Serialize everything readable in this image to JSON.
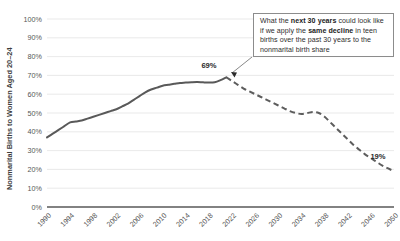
{
  "chart_data": {
    "type": "line",
    "title": "",
    "xlabel": "",
    "ylabel": "Nonmarital Births to Women Aged 20–24",
    "ylim": [
      0,
      100
    ],
    "xlim": [
      1990,
      2050
    ],
    "grid": true,
    "legend": "none",
    "y_ticks": [
      "0%",
      "10%",
      "20%",
      "30%",
      "40%",
      "50%",
      "60%",
      "70%",
      "80%",
      "90%",
      "100%"
    ],
    "x_ticks": [
      "1990",
      "1994",
      "1998",
      "2002",
      "2006",
      "2010",
      "2014",
      "2018",
      "2022",
      "2026",
      "2030",
      "2034",
      "2038",
      "2042",
      "2046",
      "2050"
    ],
    "series": [
      {
        "name": "Actual nonmarital birth share",
        "style": "solid",
        "color": "#595959",
        "x": [
          1990,
          1991,
          1992,
          1993,
          1994,
          1995,
          1996,
          1997,
          1998,
          1999,
          2000,
          2001,
          2002,
          2003,
          2004,
          2005,
          2006,
          2007,
          2008,
          2009,
          2010,
          2011,
          2012,
          2013,
          2014,
          2015,
          2016,
          2017,
          2018,
          2019,
          2020,
          2021
        ],
        "values": [
          37,
          39,
          41,
          43,
          45,
          45.5,
          46,
          47,
          48,
          49,
          50,
          51,
          52,
          53.5,
          55,
          57,
          59,
          61,
          62.5,
          63.5,
          64.5,
          65,
          65.5,
          66,
          66.2,
          66.4,
          66.5,
          66.3,
          66.2,
          66.4,
          67.5,
          69
        ]
      },
      {
        "name": "Projected share if teen-birth decline repeats",
        "style": "dashed",
        "color": "#5d5d5d",
        "x": [
          2021,
          2022,
          2023,
          2024,
          2025,
          2026,
          2027,
          2028,
          2029,
          2030,
          2031,
          2032,
          2033,
          2034,
          2035,
          2036,
          2037,
          2038,
          2039,
          2040,
          2041,
          2042,
          2043,
          2044,
          2045,
          2046,
          2047,
          2048,
          2049,
          2050
        ],
        "values": [
          69,
          67,
          65,
          63,
          61.5,
          60,
          58.5,
          57,
          55.5,
          54,
          52.5,
          51,
          50,
          49.5,
          50,
          50.5,
          50,
          48,
          45,
          42,
          39,
          36,
          33,
          30.5,
          28,
          26,
          24,
          22,
          20.5,
          19
        ]
      }
    ],
    "annotations": [
      {
        "name": "peak-label",
        "text": "69%",
        "x": 2021,
        "y": 69
      },
      {
        "name": "endpoint-label",
        "text": "19%",
        "x": 2050,
        "y": 19
      }
    ]
  },
  "callout": {
    "line1_a": "What the ",
    "line1_b": "next 30 years",
    "line1_c": " could look",
    "line2_a": "like if we apply the ",
    "line2_b": "same decline",
    "line2_c": " in",
    "line3": "teen births over the past 30 years",
    "line4": "to the nonmarital birth share"
  },
  "colors": {
    "line": "#595959",
    "grid": "#e3e3e3",
    "axis": "#595959",
    "text": "#3f3f3f",
    "box_border": "#8c8c8c"
  }
}
